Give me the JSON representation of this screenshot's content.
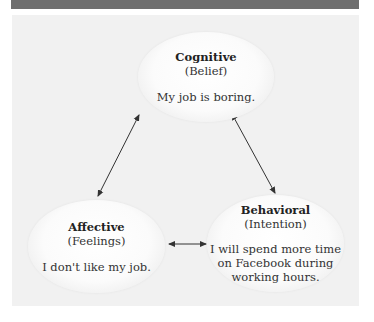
{
  "header": {
    "bar_color": "#6f6f6f"
  },
  "diagram": {
    "nodes": [
      {
        "id": "cognitive",
        "title": "Cognitive",
        "subtitle": "(Belief)",
        "lines": [
          "My job is boring."
        ]
      },
      {
        "id": "affective",
        "title": "Affective",
        "subtitle": "(Feelings)",
        "lines": [
          "I don't like my job."
        ]
      },
      {
        "id": "behavioral",
        "title": "Behavioral",
        "subtitle": "(Intention)",
        "lines": [
          "I will spend more time",
          "on Facebook during",
          "working hours."
        ]
      }
    ],
    "edges": [
      {
        "from": "cognitive",
        "to": "affective",
        "bidirectional": true
      },
      {
        "from": "cognitive",
        "to": "behavioral",
        "bidirectional": true
      },
      {
        "from": "affective",
        "to": "behavioral",
        "bidirectional": true
      }
    ],
    "colors": {
      "panel": "#f1f1f1",
      "arrow": "#333333"
    }
  }
}
